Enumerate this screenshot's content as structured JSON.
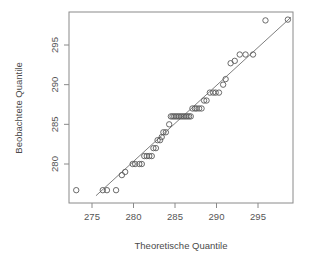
{
  "chart_data": {
    "type": "scatter",
    "title": "",
    "subtitle": "",
    "xlabel": "Theoretische Quantile",
    "ylabel": "Beobachtete Quantile",
    "xlim": [
      273.0,
      299.2
    ],
    "ylim": [
      275.6,
      298.5
    ],
    "xticks": [
      275,
      280,
      285,
      290,
      295
    ],
    "xtick_labels": [
      "275",
      "280",
      "285",
      "290",
      "295"
    ],
    "yticks": [
      280,
      285,
      290,
      295
    ],
    "ytick_labels": [
      "280",
      "285",
      "290",
      "295"
    ],
    "grid": false,
    "legend": null,
    "legend_position": "none",
    "marker": "open-circle",
    "point_color": "#5a5a5a",
    "line_color": "#6f6f6f",
    "frame_color": "#8a8a8a",
    "background_color": "#ffffff",
    "annotations": [],
    "reference_line": {
      "label": "qq-reference-line",
      "x1": 275.48,
      "y1": 276.0,
      "x2": 298.98,
      "y2": 298.5
    },
    "points": [
      {
        "x": 273.1,
        "y": 276.7
      },
      {
        "x": 276.3,
        "y": 276.7
      },
      {
        "x": 276.8,
        "y": 276.7
      },
      {
        "x": 277.9,
        "y": 276.7
      },
      {
        "x": 278.6,
        "y": 278.6
      },
      {
        "x": 279.0,
        "y": 279.0
      },
      {
        "x": 279.9,
        "y": 280.0
      },
      {
        "x": 280.2,
        "y": 280.0
      },
      {
        "x": 280.7,
        "y": 280.0
      },
      {
        "x": 281.0,
        "y": 280.0
      },
      {
        "x": 281.3,
        "y": 281.0
      },
      {
        "x": 281.6,
        "y": 281.0
      },
      {
        "x": 281.9,
        "y": 281.0
      },
      {
        "x": 282.2,
        "y": 281.0
      },
      {
        "x": 282.4,
        "y": 282.0
      },
      {
        "x": 282.7,
        "y": 282.0
      },
      {
        "x": 282.9,
        "y": 283.0
      },
      {
        "x": 283.2,
        "y": 283.0
      },
      {
        "x": 283.4,
        "y": 283.4
      },
      {
        "x": 283.6,
        "y": 284.0
      },
      {
        "x": 283.9,
        "y": 284.0
      },
      {
        "x": 284.3,
        "y": 285.0
      },
      {
        "x": 284.5,
        "y": 286.0
      },
      {
        "x": 284.7,
        "y": 286.0
      },
      {
        "x": 284.9,
        "y": 286.0
      },
      {
        "x": 285.1,
        "y": 286.0
      },
      {
        "x": 285.3,
        "y": 286.0
      },
      {
        "x": 285.5,
        "y": 286.0
      },
      {
        "x": 285.7,
        "y": 286.0
      },
      {
        "x": 285.9,
        "y": 286.0
      },
      {
        "x": 286.1,
        "y": 286.0
      },
      {
        "x": 286.3,
        "y": 286.0
      },
      {
        "x": 286.5,
        "y": 286.0
      },
      {
        "x": 286.7,
        "y": 286.0
      },
      {
        "x": 286.9,
        "y": 286.0
      },
      {
        "x": 287.1,
        "y": 287.0
      },
      {
        "x": 287.4,
        "y": 287.0
      },
      {
        "x": 287.6,
        "y": 287.0
      },
      {
        "x": 287.9,
        "y": 287.0
      },
      {
        "x": 288.2,
        "y": 287.0
      },
      {
        "x": 288.5,
        "y": 288.0
      },
      {
        "x": 288.8,
        "y": 288.0
      },
      {
        "x": 289.2,
        "y": 289.0
      },
      {
        "x": 289.6,
        "y": 289.0
      },
      {
        "x": 289.9,
        "y": 289.0
      },
      {
        "x": 290.3,
        "y": 289.0
      },
      {
        "x": 290.8,
        "y": 290.0
      },
      {
        "x": 291.1,
        "y": 290.7
      },
      {
        "x": 291.7,
        "y": 292.7
      },
      {
        "x": 292.2,
        "y": 293.0
      },
      {
        "x": 292.8,
        "y": 293.8
      },
      {
        "x": 293.5,
        "y": 293.8
      },
      {
        "x": 294.4,
        "y": 293.8
      },
      {
        "x": 295.9,
        "y": 298.1
      },
      {
        "x": 298.6,
        "y": 298.2
      }
    ]
  }
}
